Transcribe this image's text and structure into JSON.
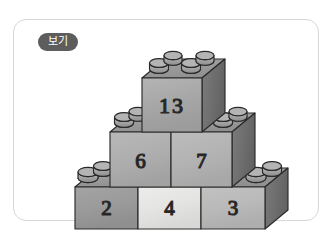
{
  "card": {
    "badge_label": "보기",
    "background": "#ffffff",
    "border_color": "#d7d7d7",
    "badge_color": "#5d5d5d",
    "badge_text_color": "#ffffff"
  },
  "diagram": {
    "type": "brick-pyramid",
    "rows": [
      {
        "level": "top",
        "bricks": [
          {
            "label": "13",
            "face_color": "#a8a8a8",
            "top_color": "#9a9a9a",
            "side_color": "#6f6f6f"
          }
        ]
      },
      {
        "level": "middle",
        "bricks": [
          {
            "label": "6",
            "face_color": "#aeaeae",
            "top_color": "#9a9a9a",
            "side_color": "#6f6f6f"
          },
          {
            "label": "7",
            "face_color": "#b2b2b2",
            "top_color": "#9a9a9a",
            "side_color": "#6f6f6f"
          }
        ]
      },
      {
        "level": "bottom",
        "bricks": [
          {
            "label": "2",
            "face_color": "#9b9b9b",
            "top_color": "#8f8f8f",
            "side_color": "#6a6a6a"
          },
          {
            "label": "4",
            "face_color": "#e2e2e0",
            "top_color": "#8f8f8f",
            "side_color": "#6a6a6a"
          },
          {
            "label": "3",
            "face_color": "#b9b9b9",
            "top_color": "#8f8f8f",
            "side_color": "#6a6a6a"
          }
        ]
      }
    ],
    "stud_color": "#9d9d9d",
    "stud_top_color": "#b4b4b4",
    "outline_color": "#2a2a2a"
  }
}
